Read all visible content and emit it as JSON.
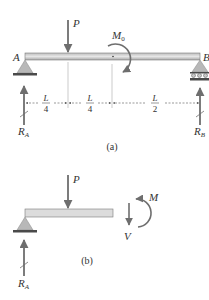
{
  "figure_a": {
    "caption": "(a)",
    "labels": {
      "support_left": "A",
      "support_right": "B",
      "load": "P",
      "moment": "M",
      "moment_sub": "0",
      "reaction_left": "R",
      "reaction_left_sub": "A",
      "reaction_right": "R",
      "reaction_right_sub": "B"
    },
    "dimensions": [
      {
        "num": "L",
        "den": "4"
      },
      {
        "num": "L",
        "den": "4"
      },
      {
        "num": "L",
        "den": "2"
      }
    ]
  },
  "figure_b": {
    "caption": "(b)",
    "labels": {
      "load": "P",
      "moment": "M",
      "shear": "V",
      "reaction_left": "R",
      "reaction_left_sub": "A"
    }
  },
  "colors": {
    "beam_fill": "#d9d9d9",
    "beam_stroke": "#7a7a7a",
    "arrow": "#6e6e6e",
    "support_fill": "#b8b8b8",
    "ground": "#4a4a4a",
    "text": "#333333"
  }
}
